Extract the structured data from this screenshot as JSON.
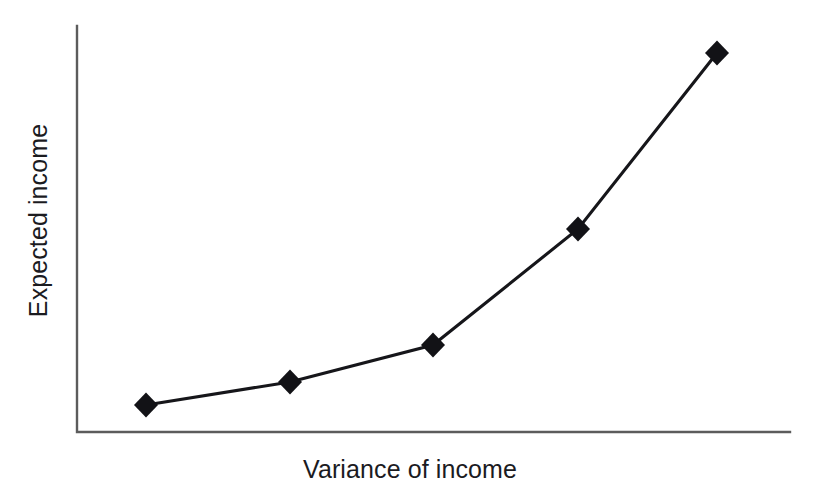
{
  "figure": {
    "background_color": "#ffffff",
    "width": 820,
    "height": 495
  },
  "chart_data": {
    "type": "line",
    "title": "",
    "subtitle": "",
    "xlabel": "Variance of income",
    "ylabel": "Expected income",
    "x": [
      1,
      2,
      3,
      4,
      5
    ],
    "values": [
      0.07,
      0.13,
      0.22,
      0.51,
      0.94
    ],
    "series": [
      {
        "name": "Expected income vs variance",
        "values": [
          0.07,
          0.13,
          0.22,
          0.51,
          0.94
        ]
      }
    ],
    "categories": [
      "1",
      "2",
      "3",
      "4",
      "5"
    ],
    "xtick_labels": [],
    "ytick_labels": [],
    "xlim": [
      0,
      6
    ],
    "ylim": [
      0,
      1
    ],
    "grid": false,
    "legend": false,
    "legend_position": "none",
    "annotations": [],
    "marker_shape": "diamond",
    "marker_color": "#121216",
    "line_color": "#16161a",
    "axis_color": "#5c5c5c",
    "points_px": [
      {
        "x": 146,
        "y": 405
      },
      {
        "x": 290,
        "y": 382
      },
      {
        "x": 433,
        "y": 345
      },
      {
        "x": 578,
        "y": 229
      },
      {
        "x": 717,
        "y": 53
      }
    ],
    "axis_px": {
      "x_origin": 77,
      "y_origin": 432,
      "x_end": 790,
      "y_top": 26
    }
  }
}
